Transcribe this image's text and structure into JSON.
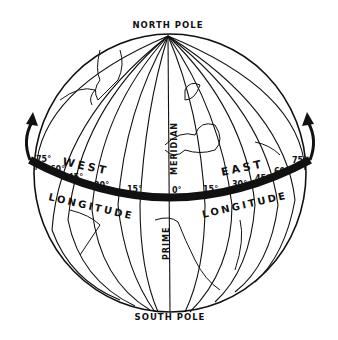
{
  "diagram": {
    "poles": {
      "north": "NORTH POLE",
      "south": "SOUTH POLE"
    },
    "meridian": {
      "upper": "MERIDIAN",
      "lower": "PRIME"
    },
    "hemispheres": {
      "west": "WEST",
      "east": "EAST"
    },
    "longitude_label": "LONGITUDE",
    "west_degrees": [
      "75°",
      "60°",
      "45°",
      "30°",
      "15°"
    ],
    "prime_degree": "0°",
    "east_degrees": [
      "15°",
      "30°",
      "45°",
      "60°",
      "75°"
    ],
    "colors": {
      "ink": "#111111",
      "background": "#ffffff"
    }
  }
}
